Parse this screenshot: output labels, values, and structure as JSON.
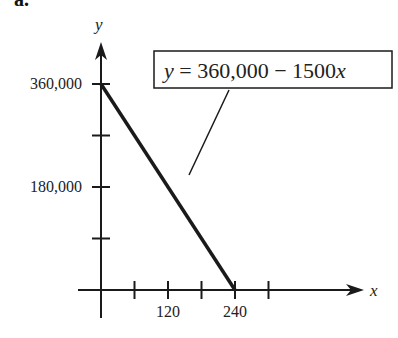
{
  "part_label": "a.",
  "chart_data": {
    "type": "line",
    "title": "",
    "xlabel": "x",
    "ylabel": "y",
    "xlim": [
      0,
      360
    ],
    "ylim": [
      0,
      400000
    ],
    "x_ticks": [
      60,
      120,
      180,
      240,
      300
    ],
    "x_tick_labels": {
      "120": "120",
      "240": "240"
    },
    "y_ticks": [
      90000,
      180000,
      270000,
      360000
    ],
    "y_tick_labels": {
      "180000": "180,000",
      "360000": "360,000"
    },
    "grid": false,
    "series": [
      {
        "name": "y = 360,000 - 1500x",
        "x": [
          0,
          240
        ],
        "y": [
          360000,
          0
        ]
      }
    ],
    "annotations": [
      {
        "text": "y = 360,000 − 1500x",
        "points_to_series": 0
      }
    ],
    "colors": {
      "line": "#1a1a1a",
      "axis": "#1a1a1a",
      "text": "#222222"
    }
  }
}
